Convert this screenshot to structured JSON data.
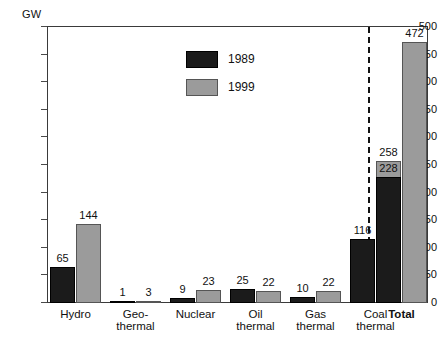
{
  "chart_data": {
    "type": "bar",
    "title": "",
    "xlabel": "",
    "ylabel": "GW",
    "ylim": [
      0,
      500
    ],
    "ytick_step": 50,
    "yticks": [
      0,
      50,
      100,
      150,
      200,
      250,
      300,
      350,
      400,
      450,
      500
    ],
    "grid": false,
    "legend_position": "inside-top-center",
    "categories": [
      "Hydro",
      "Geo-\nthermal",
      "Nuclear",
      "Oil\nthermal",
      "Gas\nthermal",
      "Coal\nthermal",
      "Total"
    ],
    "series": [
      {
        "name": "1989",
        "color": "#1b1b1b",
        "values": [
          65,
          1,
          9,
          25,
          10,
          116,
          228
        ]
      },
      {
        "name": "1999",
        "color": "#9b9b9b",
        "values": [
          144,
          3,
          23,
          22,
          22,
          258,
          472
        ]
      }
    ],
    "annotations": {
      "divider": "dashed vertical line separating Total group",
      "total_label_bold": true
    }
  },
  "axis": {
    "unit_label": "GW",
    "tick_labels": [
      "500",
      "450",
      "400",
      "350",
      "300",
      "250",
      "200",
      "150",
      "100",
      "50",
      "0"
    ]
  },
  "legend": {
    "items": [
      {
        "label": "1989",
        "swatch": "black-swatch"
      },
      {
        "label": "1999",
        "swatch": "gray-swatch"
      }
    ]
  }
}
